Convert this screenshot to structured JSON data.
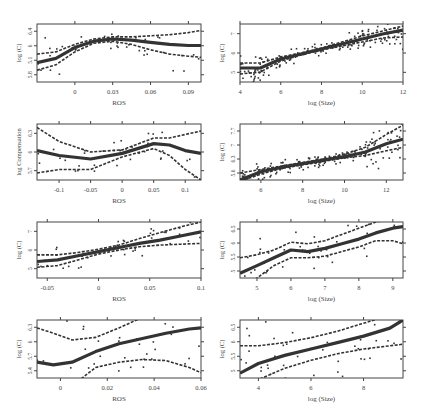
{
  "chart_data": [
    {
      "type": "scatter",
      "panel": "row1-left",
      "xlabel": "ROS",
      "ylabel": "log (C)",
      "xticks": [
        "0",
        "0.03",
        "0.06",
        "0.09"
      ],
      "xtick_values": [
        0,
        0.03,
        0.06,
        0.09
      ],
      "yticks": [
        "5.8",
        "5.1",
        "6",
        "6.4"
      ],
      "xlim": [
        -0.03,
        0.1
      ],
      "ylim": [
        4.3,
        7.0
      ],
      "smooth": {
        "x": [
          -0.03,
          -0.015,
          0,
          0.015,
          0.03,
          0.045,
          0.06,
          0.075,
          0.09,
          0.1
        ],
        "y": [
          5.2,
          5.4,
          5.9,
          6.2,
          6.3,
          6.25,
          6.15,
          6.05,
          6.0,
          6.0
        ]
      },
      "upper": {
        "x": [
          -0.03,
          -0.015,
          0,
          0.015,
          0.03,
          0.045,
          0.06,
          0.075,
          0.09,
          0.1
        ],
        "y": [
          5.6,
          5.7,
          6.05,
          6.3,
          6.4,
          6.4,
          6.45,
          6.5,
          6.6,
          6.7
        ]
      },
      "lower": {
        "x": [
          -0.03,
          -0.015,
          0,
          0.015,
          0.03,
          0.045,
          0.06,
          0.075,
          0.09,
          0.1
        ],
        "y": [
          4.85,
          5.1,
          5.7,
          6.1,
          6.2,
          6.05,
          5.8,
          5.6,
          5.5,
          5.45
        ]
      },
      "grid": false
    },
    {
      "type": "scatter",
      "panel": "row1-right",
      "xlabel": "log (Size)",
      "ylabel": "log (C)",
      "xticks": [
        "4",
        "6",
        "8",
        "10",
        "12"
      ],
      "xtick_values": [
        4,
        6,
        8,
        10,
        12
      ],
      "yticks": [
        "5",
        "6",
        "7"
      ],
      "xlim": [
        4,
        12
      ],
      "ylim": [
        4.6,
        7.5
      ],
      "smooth": {
        "x": [
          4,
          5,
          6,
          7,
          8,
          9,
          10,
          11,
          12
        ],
        "y": [
          5.3,
          5.3,
          5.75,
          6.0,
          6.25,
          6.5,
          6.75,
          7.0,
          7.2
        ]
      },
      "upper": {
        "x": [
          4,
          5,
          6,
          7,
          8,
          9,
          10,
          11,
          12
        ],
        "y": [
          5.55,
          5.55,
          5.85,
          6.05,
          6.3,
          6.6,
          6.9,
          7.15,
          7.4
        ]
      },
      "lower": {
        "x": [
          4,
          5,
          6,
          7,
          8,
          9,
          10,
          11,
          12
        ],
        "y": [
          5.0,
          5.1,
          5.65,
          5.95,
          6.2,
          6.4,
          6.6,
          6.8,
          6.85
        ]
      },
      "grid": false
    },
    {
      "type": "scatter",
      "panel": "row2-left",
      "xlabel": "ROS",
      "ylabel": "log Compensation",
      "xticks": [
        "-0.1",
        "-0.05",
        "0",
        "0.05",
        "0.1"
      ],
      "xtick_values": [
        -0.1,
        -0.05,
        0,
        0.05,
        0.1
      ],
      "yticks": [
        "5.7",
        "6",
        "6.3"
      ],
      "xlim": [
        -0.135,
        0.125
      ],
      "ylim": [
        5.65,
        6.45
      ],
      "smooth": {
        "x": [
          -0.135,
          -0.1,
          -0.05,
          0,
          0.05,
          0.075,
          0.1,
          0.125
        ],
        "y": [
          6.07,
          6.0,
          5.95,
          6.03,
          6.17,
          6.15,
          6.07,
          6.03
        ]
      },
      "upper": {
        "x": [
          -0.135,
          -0.1,
          -0.05,
          0,
          0.05,
          0.075,
          0.1,
          0.125
        ],
        "y": [
          6.4,
          6.2,
          6.05,
          6.08,
          6.25,
          6.25,
          6.3,
          6.35
        ]
      },
      "lower": {
        "x": [
          -0.135,
          -0.1,
          -0.05,
          0,
          0.05,
          0.075,
          0.1,
          0.125
        ],
        "y": [
          5.75,
          5.8,
          5.8,
          5.98,
          6.1,
          6.0,
          5.8,
          5.65
        ]
      },
      "grid": false
    },
    {
      "type": "scatter",
      "panel": "row2-right",
      "xlabel": "log (Size)",
      "ylabel": "log (C)",
      "xticks": [
        "6",
        "8",
        "10",
        "12"
      ],
      "xtick_values": [
        6,
        8,
        10,
        12
      ],
      "yticks": [
        "5.6",
        "6.3",
        "7",
        "7.7"
      ],
      "xlim": [
        5,
        12.8
      ],
      "ylim": [
        5.4,
        7.8
      ],
      "smooth": {
        "x": [
          5,
          6,
          7,
          8,
          9,
          10,
          11,
          12,
          12.8
        ],
        "y": [
          5.4,
          5.75,
          5.95,
          6.1,
          6.25,
          6.4,
          6.6,
          6.95,
          7.15
        ]
      },
      "upper": {
        "x": [
          5,
          6,
          7,
          8,
          9,
          10,
          11,
          12,
          12.8
        ],
        "y": [
          5.7,
          5.85,
          6.0,
          6.15,
          6.3,
          6.5,
          6.8,
          7.35,
          7.75
        ]
      },
      "lower": {
        "x": [
          5,
          6,
          7,
          8,
          9,
          10,
          11,
          12,
          12.8
        ],
        "y": [
          5.35,
          5.65,
          5.9,
          6.05,
          6.2,
          6.35,
          6.45,
          6.65,
          6.8
        ]
      },
      "grid": false
    },
    {
      "type": "scatter",
      "panel": "row3-left",
      "xlabel": "ROS",
      "ylabel": "log (C)",
      "xticks": [
        "-0.05",
        "0",
        "0.05",
        "0.1"
      ],
      "xtick_values": [
        -0.05,
        0,
        0.05,
        0.1
      ],
      "yticks": [
        "5",
        "6",
        "7"
      ],
      "xlim": [
        -0.06,
        0.1
      ],
      "ylim": [
        4.2,
        7.6
      ],
      "smooth": {
        "x": [
          -0.06,
          -0.04,
          -0.02,
          0,
          0.02,
          0.04,
          0.06,
          0.08,
          0.1
        ],
        "y": [
          5.2,
          5.3,
          5.55,
          5.8,
          6.05,
          6.3,
          6.5,
          6.75,
          7.0
        ]
      },
      "upper": {
        "x": [
          -0.06,
          -0.04,
          -0.02,
          0,
          0.02,
          0.04,
          0.06,
          0.08,
          0.1
        ],
        "y": [
          5.6,
          5.6,
          5.75,
          5.95,
          6.2,
          6.6,
          6.95,
          7.3,
          7.6
        ]
      },
      "lower": {
        "x": [
          -0.06,
          -0.04,
          -0.02,
          0,
          0.02,
          0.04,
          0.06,
          0.08,
          0.1
        ],
        "y": [
          4.85,
          4.95,
          5.3,
          5.65,
          5.9,
          6.1,
          6.2,
          6.25,
          6.3
        ]
      },
      "grid": false
    },
    {
      "type": "scatter",
      "panel": "row3-right",
      "xlabel": "log (Size)",
      "ylabel": "log (C)",
      "xticks": [
        "5",
        "6",
        "7",
        "8",
        "9"
      ],
      "xtick_values": [
        5,
        6,
        7,
        8,
        9
      ],
      "yticks": [
        "5",
        "5.5",
        "6",
        "6.5"
      ],
      "xlim": [
        4.5,
        9.3
      ],
      "ylim": [
        4.9,
        6.7
      ],
      "smooth": {
        "x": [
          4.5,
          5,
          5.5,
          6,
          6.5,
          7,
          7.5,
          8,
          8.5,
          9,
          9.3
        ],
        "y": [
          5.05,
          5.3,
          5.55,
          5.8,
          5.75,
          5.85,
          6.0,
          6.15,
          6.35,
          6.5,
          6.55
        ]
      },
      "upper": {
        "x": [
          4.5,
          5,
          5.5,
          6,
          6.5,
          7,
          7.5,
          8,
          8.5,
          9,
          9.3
        ],
        "y": [
          5.55,
          5.65,
          5.8,
          6.05,
          6.0,
          6.1,
          6.3,
          6.5,
          6.7,
          6.8,
          6.85
        ]
      },
      "lower": {
        "x": [
          4.5,
          5,
          5.5,
          6,
          6.5,
          7,
          7.5,
          8,
          8.5,
          9,
          9.3
        ],
        "y": [
          4.55,
          4.9,
          5.3,
          5.55,
          5.55,
          5.6,
          5.75,
          5.9,
          6.1,
          6.1,
          6.0
        ]
      },
      "grid": false
    },
    {
      "type": "scatter",
      "panel": "row4-left",
      "xlabel": "ROS",
      "ylabel": "log (C)",
      "xticks": [
        "0",
        "0.02",
        "0.04",
        "0.06"
      ],
      "xtick_values": [
        0,
        0.02,
        0.04,
        0.06
      ],
      "yticks": [
        "5.4",
        "5.7",
        "6",
        "6.3"
      ],
      "xlim": [
        -0.01,
        0.06
      ],
      "ylim": [
        5.35,
        6.45
      ],
      "smooth": {
        "x": [
          -0.01,
          -0.003,
          0.005,
          0.015,
          0.025,
          0.035,
          0.045,
          0.055,
          0.06
        ],
        "y": [
          5.65,
          5.6,
          5.65,
          5.85,
          6.0,
          6.1,
          6.2,
          6.28,
          6.3
        ]
      },
      "upper": {
        "x": [
          -0.01,
          -0.003,
          0.005,
          0.015,
          0.025,
          0.035,
          0.045,
          0.055,
          0.06
        ],
        "y": [
          6.3,
          6.2,
          6.07,
          6.12,
          6.3,
          6.5,
          6.6,
          6.7,
          6.75
        ]
      },
      "lower": {
        "x": [
          -0.01,
          -0.003,
          0.005,
          0.015,
          0.025,
          0.035,
          0.045,
          0.055,
          0.06
        ],
        "y": [
          5.0,
          5.0,
          5.2,
          5.55,
          5.65,
          5.7,
          5.68,
          5.55,
          5.45
        ]
      },
      "grid": false
    },
    {
      "type": "scatter",
      "panel": "row4-right",
      "xlabel": "log (Size)",
      "ylabel": "log (C)",
      "xticks": [
        "4",
        "6",
        "8"
      ],
      "xtick_values": [
        4,
        6,
        8
      ],
      "yticks": [
        "5",
        "5.5",
        "6",
        "6.5"
      ],
      "xlim": [
        3.3,
        9.5
      ],
      "ylim": [
        4.85,
        6.65
      ],
      "smooth": {
        "x": [
          3.3,
          4,
          5,
          6,
          7,
          8,
          9,
          9.5
        ],
        "y": [
          5.0,
          5.3,
          5.55,
          5.75,
          5.95,
          6.15,
          6.4,
          6.65
        ]
      },
      "upper": {
        "x": [
          3.3,
          4,
          5,
          6,
          7,
          8,
          9,
          9.5
        ],
        "y": [
          5.85,
          5.85,
          5.95,
          6.1,
          6.3,
          6.55,
          6.8,
          6.95
        ]
      },
      "lower": {
        "x": [
          3.3,
          4,
          5,
          6,
          7,
          8,
          9,
          9.5
        ],
        "y": [
          4.5,
          4.8,
          5.15,
          5.4,
          5.6,
          5.75,
          5.85,
          5.9
        ]
      },
      "grid": false
    }
  ],
  "layout": {
    "panels": [
      {
        "left": 37,
        "top": 24,
        "width": 164,
        "height": 58
      },
      {
        "left": 240,
        "top": 24,
        "width": 163,
        "height": 58
      },
      {
        "left": 37,
        "top": 124,
        "width": 164,
        "height": 56
      },
      {
        "left": 240,
        "top": 124,
        "width": 163,
        "height": 56
      },
      {
        "left": 37,
        "top": 222,
        "width": 164,
        "height": 56
      },
      {
        "left": 240,
        "top": 222,
        "width": 163,
        "height": 56
      },
      {
        "left": 37,
        "top": 320,
        "width": 164,
        "height": 58
      },
      {
        "left": 240,
        "top": 320,
        "width": 163,
        "height": 58
      }
    ],
    "line_color": "#333333",
    "point_color": "#333333"
  }
}
